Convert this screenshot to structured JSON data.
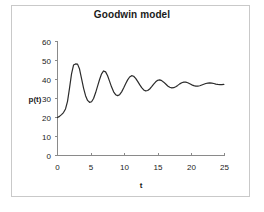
{
  "figure": {
    "background_color": "#ffffff",
    "frame_color": "#c9c9c9"
  },
  "chart_data": {
    "type": "line",
    "title": "Goodwin model",
    "xlabel": "t",
    "ylabel": "p(t)",
    "xlim": [
      0,
      25
    ],
    "ylim": [
      0,
      60
    ],
    "xticks": [
      0,
      5,
      10,
      15,
      20,
      25
    ],
    "yticks": [
      0,
      10,
      20,
      30,
      40,
      50,
      60
    ],
    "grid": false,
    "legend": null,
    "line_color": "#2b2b2b",
    "series": [
      {
        "name": "p(t)",
        "x": [
          0.0,
          0.3,
          0.6,
          0.9,
          1.2,
          1.5,
          1.8,
          2.1,
          2.4,
          2.7,
          3.0,
          3.3,
          3.6,
          3.9,
          4.2,
          4.5,
          4.8,
          5.1,
          5.4,
          5.7,
          6.0,
          6.3,
          6.6,
          6.9,
          7.2,
          7.5,
          7.8,
          8.1,
          8.4,
          8.7,
          9.0,
          9.3,
          9.6,
          9.9,
          10.2,
          10.5,
          10.8,
          11.1,
          11.4,
          11.7,
          12.0,
          12.3,
          12.6,
          12.9,
          13.2,
          13.5,
          13.8,
          14.1,
          14.4,
          14.7,
          15.0,
          15.3,
          15.6,
          15.9,
          16.2,
          16.5,
          16.8,
          17.1,
          17.4,
          17.7,
          18.0,
          18.3,
          18.6,
          18.9,
          19.2,
          19.5,
          19.8,
          20.1,
          20.4,
          20.7,
          21.0,
          21.3,
          21.6,
          21.9,
          22.2,
          22.5,
          22.8,
          23.1,
          23.4,
          23.7,
          24.0,
          24.3,
          24.6,
          24.9
        ],
        "y": [
          20.0,
          20.6,
          21.5,
          22.6,
          24.5,
          28.5,
          35.5,
          43.0,
          47.6,
          48.2,
          48.1,
          45.5,
          40.5,
          35.5,
          31.5,
          29.0,
          28.0,
          28.3,
          30.0,
          33.0,
          36.5,
          40.0,
          43.0,
          44.5,
          44.0,
          42.0,
          39.0,
          36.0,
          33.5,
          32.0,
          31.5,
          32.0,
          33.5,
          35.5,
          37.8,
          39.8,
          41.3,
          42.0,
          41.7,
          40.6,
          39.0,
          37.3,
          35.7,
          34.5,
          34.0,
          34.2,
          35.0,
          36.2,
          37.6,
          38.8,
          39.6,
          39.8,
          39.4,
          38.6,
          37.6,
          36.6,
          35.9,
          35.6,
          35.7,
          36.2,
          36.9,
          37.7,
          38.3,
          38.6,
          38.6,
          38.3,
          37.8,
          37.2,
          36.8,
          36.5,
          36.5,
          36.7,
          37.1,
          37.5,
          37.9,
          38.1,
          38.2,
          38.1,
          37.9,
          37.6,
          37.4,
          37.3,
          37.3,
          37.4
        ]
      }
    ]
  },
  "labels": {
    "title": "Goodwin model",
    "y_axis_title": "p(t)",
    "x_axis_title": "t",
    "y_tick_labels": [
      "60",
      "50",
      "40",
      "30",
      "20",
      "10",
      "0"
    ],
    "x_tick_labels": [
      "0",
      "5",
      "10",
      "15",
      "20",
      "25"
    ]
  }
}
